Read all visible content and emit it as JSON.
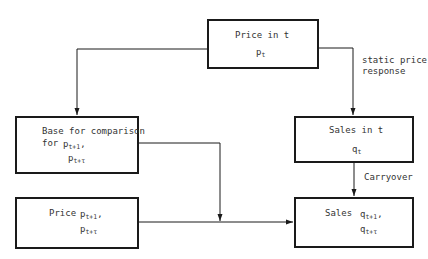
{
  "diagram": {
    "nodes": {
      "price_t": {
        "label": "Price in t",
        "symbol": "p",
        "sub": "t"
      },
      "base": {
        "label": "Base for comparison",
        "label2": "for",
        "symbol1": "p",
        "sub1": "t+1",
        "sep": ",",
        "symbol2": "p",
        "sub2": "t+τ"
      },
      "sales_t": {
        "label": "Sales in t",
        "symbol": "q",
        "sub": "t"
      },
      "price_future": {
        "label": "Price",
        "symbol1": "p",
        "sub1": "t+1",
        "sep": ",",
        "symbol2": "p",
        "sub2": "t+τ"
      },
      "sales_future": {
        "label": "Sales",
        "symbol1": "q",
        "sub1": "t+1",
        "sep": ",",
        "symbol2": "q",
        "sub2": "t+τ"
      }
    },
    "edges": {
      "static_response": {
        "label1": "static price",
        "label2": "response"
      },
      "carryover": {
        "label": "Carryover"
      }
    },
    "colors": {
      "line": "#1a1a1a",
      "text": "#333333"
    }
  }
}
